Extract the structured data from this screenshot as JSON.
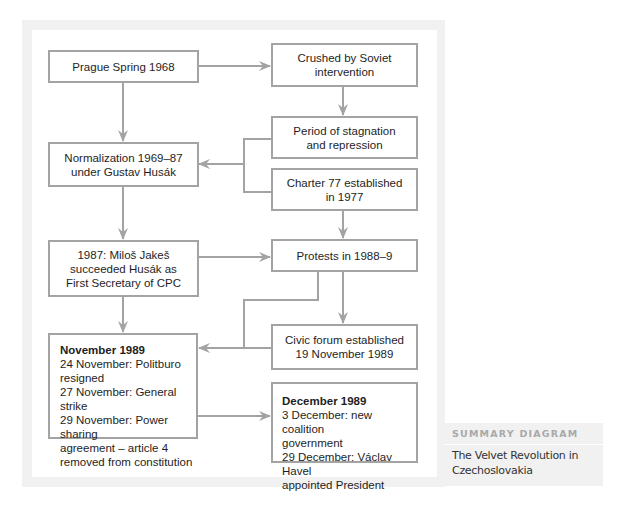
{
  "diagram": {
    "nodes": {
      "prague_spring": {
        "lines": [
          "Prague Spring 1968"
        ]
      },
      "crushed": {
        "lines": [
          "Crushed by Soviet",
          "intervention"
        ]
      },
      "stagnation": {
        "lines": [
          "Period of stagnation",
          "and repression"
        ]
      },
      "normalization": {
        "lines": [
          "Normalization 1969–87",
          "under Gustav Husák"
        ]
      },
      "charter77": {
        "lines": [
          "Charter 77 established",
          "in 1977"
        ]
      },
      "jakes": {
        "lines": [
          "1987: Miloš Jakeš",
          "succeeded Husák as",
          "First Secretary of CPC"
        ]
      },
      "protests": {
        "lines": [
          "Protests in 1988–9"
        ]
      },
      "civic_forum": {
        "lines": [
          "Civic forum established",
          "19 November 1989"
        ]
      },
      "november": {
        "title": "November 1989",
        "lines": [
          "24 November: Politburo",
          "resigned",
          "27 November: General strike",
          "29 November: Power sharing",
          "agreement – article 4",
          "removed from constitution"
        ]
      },
      "december": {
        "title": "December 1989",
        "lines": [
          "3 December: new coalition",
          "government",
          "29 December: Václav Havel",
          "appointed President"
        ]
      }
    },
    "edges": [
      {
        "from": "prague_spring",
        "to": "crushed"
      },
      {
        "from": "prague_spring",
        "to": "normalization"
      },
      {
        "from": "crushed",
        "to": "stagnation"
      },
      {
        "from": "stagnation",
        "to": "normalization"
      },
      {
        "from": "charter77",
        "to": "normalization"
      },
      {
        "from": "normalization",
        "to": "jakes"
      },
      {
        "from": "charter77",
        "to": "protests"
      },
      {
        "from": "jakes",
        "to": "protests"
      },
      {
        "from": "jakes",
        "to": "november"
      },
      {
        "from": "protests",
        "to": "civic_forum"
      },
      {
        "from": "protests",
        "to": "november"
      },
      {
        "from": "civic_forum",
        "to": "november"
      },
      {
        "from": "november",
        "to": "december"
      }
    ],
    "colors": {
      "line": "#a3a3a3",
      "panel": "#f1f1f1"
    }
  },
  "summary": {
    "heading": "SUMMARY DIAGRAM",
    "caption_lines": [
      "The Velvet Revolution in",
      "Czechoslovakia"
    ]
  }
}
